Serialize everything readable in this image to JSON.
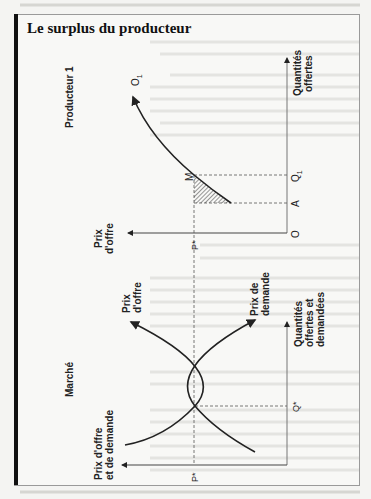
{
  "title": "Le surplus du producteur",
  "colors": {
    "ink": "#222222",
    "frame": "#9a9a9a",
    "bar": "#111111",
    "paper": "#f4f4f2"
  },
  "producer": {
    "panel_label": "Producteur 1",
    "price_axis_label": [
      "Prix",
      "d'offre"
    ],
    "quantity_axis_label": [
      "Quantités",
      "offertes"
    ],
    "curve_label": "O",
    "curve_subscript": "1",
    "origin_label": "O",
    "point_label_M": "M",
    "qty_tick_A": "A",
    "qty_tick_Q1": "Q",
    "qty_tick_Q1_sub": "1",
    "price_tick": "P*",
    "shaded_area": "producer surplus (hatched)"
  },
  "market": {
    "panel_label": "Marché",
    "price_axis_label": [
      "Prix d'offre",
      "et de demande"
    ],
    "quantity_axis_label": [
      "Quantités",
      "offertes et",
      "demandées"
    ],
    "supply_label": [
      "Prix",
      "d'offre"
    ],
    "demand_label": [
      "Prix de",
      "demande"
    ],
    "price_tick": "P*",
    "qty_tick": "Q*"
  }
}
